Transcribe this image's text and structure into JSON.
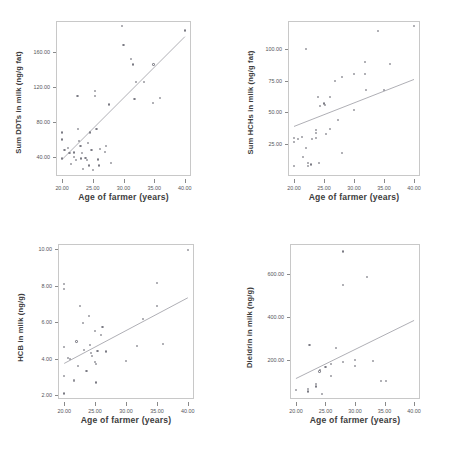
{
  "figure": {
    "layout": "2x2-grid-of-scatterplots",
    "panel_count": 4
  },
  "panels": [
    {
      "id": "panel-sum-ddts",
      "ylabel": "Sum DDTs in milk (ng/g fat)",
      "xlabel": "Age of farmer (years)",
      "yticks": [
        "40.00",
        "80.00",
        "120.00",
        "160.00"
      ],
      "xticks": [
        "20.00",
        "25.00",
        "30.00",
        "35.00",
        "40.00"
      ]
    },
    {
      "id": "panel-sum-hchs",
      "ylabel": "Sum HCHs in milk (ng/g fat)",
      "xlabel": "Age of farmer (years)",
      "yticks": [
        "25.00",
        "50.00",
        "75.00",
        "100.00"
      ],
      "xticks": [
        "20.00",
        "25.00",
        "30.00",
        "35.00",
        "40.00"
      ]
    },
    {
      "id": "panel-hcb",
      "ylabel": "HCB in milk (ng/g)",
      "xlabel": "Age of farmer (years)",
      "yticks": [
        "2.00",
        "4.00",
        "6.00",
        "8.00",
        "10.00"
      ],
      "xticks": [
        "20.00",
        "25.00",
        "30.00",
        "35.00",
        "40.00"
      ]
    },
    {
      "id": "panel-dieldrin",
      "ylabel": "Dieldrin in milk (ng/g)",
      "xlabel": "Age of farmer (years)",
      "yticks": [
        "200.00",
        "400.00",
        "600.00"
      ],
      "xticks": [
        "20.00",
        "25.00",
        "30.00",
        "35.00",
        "40.00"
      ]
    }
  ],
  "chart_data": [
    {
      "type": "scatter",
      "id": "panel-sum-ddts",
      "title": "",
      "xlabel": "Age of farmer (years)",
      "ylabel": "Sum DDTs in milk (ng/g fat)",
      "xlim": [
        19.0,
        41.0
      ],
      "ylim": [
        18.0,
        196.0
      ],
      "xticks": [
        20,
        25,
        30,
        35,
        40
      ],
      "yticks": [
        40,
        80,
        120,
        160
      ],
      "grid": false,
      "legend": "none",
      "regression_line": {
        "x": [
          20.0,
          40.0
        ],
        "y": [
          37.0,
          178.0
        ]
      },
      "points": [
        {
          "x": 20.0,
          "y": 38.0
        },
        {
          "x": 20.0,
          "y": 60.0
        },
        {
          "x": 20.0,
          "y": 68.0
        },
        {
          "x": 20.4,
          "y": 48.0
        },
        {
          "x": 21.0,
          "y": 50.0
        },
        {
          "x": 21.2,
          "y": 44.0
        },
        {
          "x": 21.5,
          "y": 32.0
        },
        {
          "x": 22.0,
          "y": 40.0
        },
        {
          "x": 22.0,
          "y": 45.0
        },
        {
          "x": 22.2,
          "y": 36.0
        },
        {
          "x": 22.5,
          "y": 110.0
        },
        {
          "x": 22.6,
          "y": 72.0
        },
        {
          "x": 22.8,
          "y": 58.0
        },
        {
          "x": 23.0,
          "y": 52.0
        },
        {
          "x": 23.1,
          "y": 38.0
        },
        {
          "x": 23.2,
          "y": 44.0
        },
        {
          "x": 23.4,
          "y": 26.0
        },
        {
          "x": 23.8,
          "y": 39.0
        },
        {
          "x": 24.0,
          "y": 36.0
        },
        {
          "x": 24.2,
          "y": 56.0
        },
        {
          "x": 24.4,
          "y": 30.0
        },
        {
          "x": 24.5,
          "y": 68.0
        },
        {
          "x": 24.8,
          "y": 48.0
        },
        {
          "x": 25.0,
          "y": 25.0
        },
        {
          "x": 25.3,
          "y": 110.0
        },
        {
          "x": 25.4,
          "y": 116.0
        },
        {
          "x": 25.6,
          "y": 72.0
        },
        {
          "x": 25.8,
          "y": 37.0
        },
        {
          "x": 26.0,
          "y": 30.0
        },
        {
          "x": 26.2,
          "y": 49.0
        },
        {
          "x": 27.0,
          "y": 46.0
        },
        {
          "x": 27.2,
          "y": 52.0
        },
        {
          "x": 27.6,
          "y": 100.0
        },
        {
          "x": 28.0,
          "y": 33.0
        },
        {
          "x": 29.8,
          "y": 190.0
        },
        {
          "x": 30.0,
          "y": 168.0
        },
        {
          "x": 31.2,
          "y": 152.0
        },
        {
          "x": 31.5,
          "y": 146.0
        },
        {
          "x": 31.8,
          "y": 106.0
        },
        {
          "x": 32.0,
          "y": 126.0
        },
        {
          "x": 33.4,
          "y": 126.0
        },
        {
          "x": 34.8,
          "y": 102.0
        },
        {
          "x": 34.9,
          "y": 146.0
        },
        {
          "x": 36.0,
          "y": 108.0
        },
        {
          "x": 40.0,
          "y": 185.0
        }
      ]
    },
    {
      "type": "scatter",
      "id": "panel-sum-hchs",
      "title": "",
      "xlabel": "Age of farmer (years)",
      "ylabel": "Sum HCHs in milk (ng/g fat)",
      "xlim": [
        19.0,
        41.0
      ],
      "ylim": [
        0.0,
        122.0
      ],
      "xticks": [
        20,
        25,
        30,
        35,
        40
      ],
      "yticks": [
        25,
        50,
        75,
        100
      ],
      "grid": false,
      "legend": "none",
      "regression_line": {
        "x": [
          20.0,
          40.0
        ],
        "y": [
          39.0,
          76.0
        ]
      },
      "points": [
        {
          "x": 20.0,
          "y": 30.0
        },
        {
          "x": 20.0,
          "y": 27.0
        },
        {
          "x": 20.0,
          "y": 8.0
        },
        {
          "x": 20.6,
          "y": 29.0
        },
        {
          "x": 21.3,
          "y": 31.0
        },
        {
          "x": 21.5,
          "y": 15.0
        },
        {
          "x": 22.0,
          "y": 100.0
        },
        {
          "x": 22.0,
          "y": 22.0
        },
        {
          "x": 22.4,
          "y": 8.0
        },
        {
          "x": 22.4,
          "y": 10.0
        },
        {
          "x": 22.9,
          "y": 9.0
        },
        {
          "x": 23.0,
          "y": 29.0
        },
        {
          "x": 23.6,
          "y": 34.0
        },
        {
          "x": 23.6,
          "y": 36.0
        },
        {
          "x": 23.7,
          "y": 30.0
        },
        {
          "x": 24.0,
          "y": 62.0
        },
        {
          "x": 24.2,
          "y": 10.0
        },
        {
          "x": 24.4,
          "y": 55.0
        },
        {
          "x": 25.0,
          "y": 57.0
        },
        {
          "x": 25.1,
          "y": 56.0
        },
        {
          "x": 25.4,
          "y": 33.0
        },
        {
          "x": 26.0,
          "y": 37.0
        },
        {
          "x": 26.0,
          "y": 62.0
        },
        {
          "x": 26.9,
          "y": 75.0
        },
        {
          "x": 27.4,
          "y": 44.0
        },
        {
          "x": 28.0,
          "y": 78.0
        },
        {
          "x": 28.0,
          "y": 18.0
        },
        {
          "x": 30.0,
          "y": 52.0
        },
        {
          "x": 30.0,
          "y": 80.0
        },
        {
          "x": 31.8,
          "y": 90.0
        },
        {
          "x": 31.9,
          "y": 80.0
        },
        {
          "x": 32.0,
          "y": 68.0
        },
        {
          "x": 34.0,
          "y": 114.0
        },
        {
          "x": 35.0,
          "y": 68.0
        },
        {
          "x": 36.0,
          "y": 88.0
        },
        {
          "x": 40.0,
          "y": 118.0
        }
      ]
    },
    {
      "type": "scatter",
      "id": "panel-hcb",
      "title": "",
      "xlabel": "Age of farmer (years)",
      "ylabel": "HCB in milk (ng/g)",
      "xlim": [
        19.0,
        41.0
      ],
      "ylim": [
        1.8,
        10.3
      ],
      "xticks": [
        20,
        25,
        30,
        35,
        40
      ],
      "yticks": [
        2,
        4,
        6,
        8,
        10
      ],
      "grid": false,
      "legend": "none",
      "regression_line": {
        "x": [
          20.0,
          40.0
        ],
        "y": [
          3.75,
          7.35
        ]
      },
      "points": [
        {
          "x": 20.0,
          "y": 8.1
        },
        {
          "x": 20.0,
          "y": 7.85
        },
        {
          "x": 20.0,
          "y": 4.65
        },
        {
          "x": 20.0,
          "y": 3.05
        },
        {
          "x": 20.0,
          "y": 2.1
        },
        {
          "x": 20.6,
          "y": 4.05
        },
        {
          "x": 21.0,
          "y": 4.0
        },
        {
          "x": 21.6,
          "y": 2.8
        },
        {
          "x": 21.6,
          "y": 2.85
        },
        {
          "x": 22.0,
          "y": 4.95
        },
        {
          "x": 22.3,
          "y": 3.6
        },
        {
          "x": 22.6,
          "y": 6.9
        },
        {
          "x": 23.0,
          "y": 5.95
        },
        {
          "x": 23.2,
          "y": 4.5
        },
        {
          "x": 23.6,
          "y": 3.35
        },
        {
          "x": 24.0,
          "y": 6.35
        },
        {
          "x": 24.2,
          "y": 4.75
        },
        {
          "x": 24.4,
          "y": 4.3
        },
        {
          "x": 24.5,
          "y": 4.15
        },
        {
          "x": 25.0,
          "y": 5.55
        },
        {
          "x": 25.0,
          "y": 3.85
        },
        {
          "x": 25.1,
          "y": 3.7
        },
        {
          "x": 25.2,
          "y": 2.7
        },
        {
          "x": 25.4,
          "y": 4.45
        },
        {
          "x": 26.0,
          "y": 5.3
        },
        {
          "x": 26.2,
          "y": 5.75
        },
        {
          "x": 26.8,
          "y": 4.4
        },
        {
          "x": 30.0,
          "y": 3.9
        },
        {
          "x": 31.8,
          "y": 4.7
        },
        {
          "x": 32.8,
          "y": 6.2
        },
        {
          "x": 35.0,
          "y": 8.15
        },
        {
          "x": 35.0,
          "y": 6.9
        },
        {
          "x": 36.0,
          "y": 4.8
        },
        {
          "x": 40.0,
          "y": 9.95
        }
      ]
    },
    {
      "type": "scatter",
      "id": "panel-dieldrin",
      "title": "",
      "xlabel": "Age of farmer (years)",
      "ylabel": "Dieldrin in milk (ng/g)",
      "xlim": [
        19.0,
        41.0
      ],
      "ylim": [
        20.0,
        740.0
      ],
      "xticks": [
        20,
        25,
        30,
        35,
        40
      ],
      "yticks": [
        200,
        400,
        600
      ],
      "grid": false,
      "legend": "none",
      "regression_line": {
        "x": [
          20.0,
          40.0
        ],
        "y": [
          115.0,
          385.0
        ]
      },
      "points": [
        {
          "x": 20.0,
          "y": 62.0
        },
        {
          "x": 22.0,
          "y": 55.0
        },
        {
          "x": 22.0,
          "y": 65.0
        },
        {
          "x": 22.3,
          "y": 270.0
        },
        {
          "x": 23.4,
          "y": 78.0
        },
        {
          "x": 23.4,
          "y": 88.0
        },
        {
          "x": 24.0,
          "y": 148.0
        },
        {
          "x": 24.1,
          "y": 155.0
        },
        {
          "x": 24.4,
          "y": 45.0
        },
        {
          "x": 25.0,
          "y": 168.0
        },
        {
          "x": 26.0,
          "y": 182.0
        },
        {
          "x": 26.0,
          "y": 128.0
        },
        {
          "x": 26.8,
          "y": 258.0
        },
        {
          "x": 28.0,
          "y": 705.0
        },
        {
          "x": 28.0,
          "y": 550.0
        },
        {
          "x": 28.0,
          "y": 192.0
        },
        {
          "x": 30.0,
          "y": 200.0
        },
        {
          "x": 30.0,
          "y": 172.0
        },
        {
          "x": 32.0,
          "y": 588.0
        },
        {
          "x": 33.0,
          "y": 198.0
        },
        {
          "x": 34.4,
          "y": 102.0
        },
        {
          "x": 35.2,
          "y": 102.0
        }
      ]
    }
  ]
}
